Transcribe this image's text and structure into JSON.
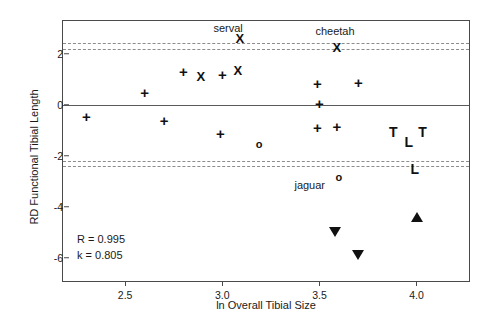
{
  "chart_data": {
    "type": "scatter",
    "title": "",
    "xlabel": "ln Overall Tibial Size",
    "ylabel": "RD Functional Tibial Length",
    "xlim": [
      2.18,
      4.28
    ],
    "ylim": [
      -7.0,
      3.3
    ],
    "xticks": [
      "2.5",
      "3.0",
      "3.5",
      "4.0"
    ],
    "xtick_values": [
      2.5,
      3.0,
      3.5,
      4.0
    ],
    "yticks": [
      "2",
      "0",
      "-2",
      "-4",
      "-6"
    ],
    "ytick_values": [
      2,
      0,
      -2,
      -4,
      -6
    ],
    "grid": false,
    "legend": "none",
    "reference_lines": {
      "zero_line": 0,
      "dashed_bands": [
        2.42,
        2.2,
        -2.2,
        -2.42
      ]
    },
    "points": [
      {
        "x": 2.3,
        "y": -0.42,
        "marker": "plus"
      },
      {
        "x": 2.6,
        "y": 0.52,
        "marker": "plus"
      },
      {
        "x": 2.7,
        "y": -0.6,
        "marker": "plus"
      },
      {
        "x": 2.8,
        "y": 1.32,
        "marker": "plus"
      },
      {
        "x": 2.89,
        "y": 1.12,
        "marker": "x"
      },
      {
        "x": 3.0,
        "y": 1.21,
        "marker": "plus"
      },
      {
        "x": 2.99,
        "y": -1.12,
        "marker": "plus"
      },
      {
        "x": 3.08,
        "y": 1.38,
        "marker": "x"
      },
      {
        "x": 3.09,
        "y": 2.62,
        "marker": "x",
        "label": "serval"
      },
      {
        "x": 3.19,
        "y": -1.53,
        "marker": "circle"
      },
      {
        "x": 3.49,
        "y": 0.88,
        "marker": "plus"
      },
      {
        "x": 3.5,
        "y": 0.07,
        "marker": "plus"
      },
      {
        "x": 3.49,
        "y": -0.86,
        "marker": "plus"
      },
      {
        "x": 3.59,
        "y": -0.83,
        "marker": "plus"
      },
      {
        "x": 3.59,
        "y": 2.27,
        "marker": "x",
        "label": "cheetah"
      },
      {
        "x": 3.7,
        "y": 0.89,
        "marker": "plus"
      },
      {
        "x": 3.6,
        "y": -2.85,
        "marker": "circle",
        "label": "jaguar"
      },
      {
        "x": 3.88,
        "y": -1.08,
        "marker": "T"
      },
      {
        "x": 3.96,
        "y": -1.45,
        "marker": "L"
      },
      {
        "x": 4.03,
        "y": -1.05,
        "marker": "T"
      },
      {
        "x": 3.99,
        "y": -2.53,
        "marker": "L"
      },
      {
        "x": 3.58,
        "y": -5.0,
        "marker": "triangle-down"
      },
      {
        "x": 3.7,
        "y": -5.88,
        "marker": "triangle-down"
      },
      {
        "x": 4.0,
        "y": -4.42,
        "marker": "triangle-up"
      }
    ],
    "annotations": [
      {
        "text": "serval",
        "x": 3.03,
        "y": 3.02
      },
      {
        "text": "cheetah",
        "x": 3.58,
        "y": 2.92
      },
      {
        "text": "jaguar",
        "x": 3.45,
        "y": -3.13
      }
    ],
    "stats": {
      "correlation_label": "R = 0.995",
      "slope_label": "k = 0.805"
    }
  }
}
